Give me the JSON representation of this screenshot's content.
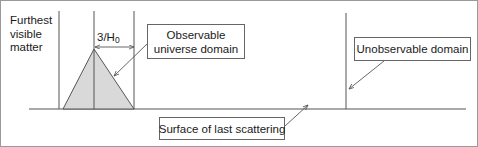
{
  "figure": {
    "width": 478,
    "height": 147,
    "background_color": "#ffffff",
    "border_color": "#9a9a9a",
    "line_color": "#555555",
    "triangle_fill_color": "#d9d9d9",
    "triangle_stroke_color": "#555555",
    "box_border_color": "#666666",
    "text_color": "#1a1a1a"
  },
  "labels": {
    "furthest_visible_matter": "Furthest\nvisible\nmatter",
    "hubble_distance_numerator": "3/H",
    "hubble_distance_subscript": "0",
    "observable_universe_domain": "Observable\nuniverse domain",
    "unobservable_domain": "Unobservable domain",
    "surface_of_last_scattering": "Surface of last scattering"
  },
  "geometry": {
    "baseline_y": 108,
    "baseline_x_start": 28,
    "baseline_x_end": 465,
    "left_vertical_line_x": 58,
    "apex_vertical_line_x": 93,
    "right_vertical_line_x": 133,
    "far_right_vertical_line_x": 345,
    "triangle_apex_x": 93,
    "triangle_apex_y": 48,
    "triangle_base_left_x": 62,
    "triangle_base_right_x": 133,
    "dimension_arrow_y": 46,
    "dimension_arrow_x_start": 93,
    "dimension_arrow_x_end": 134
  }
}
